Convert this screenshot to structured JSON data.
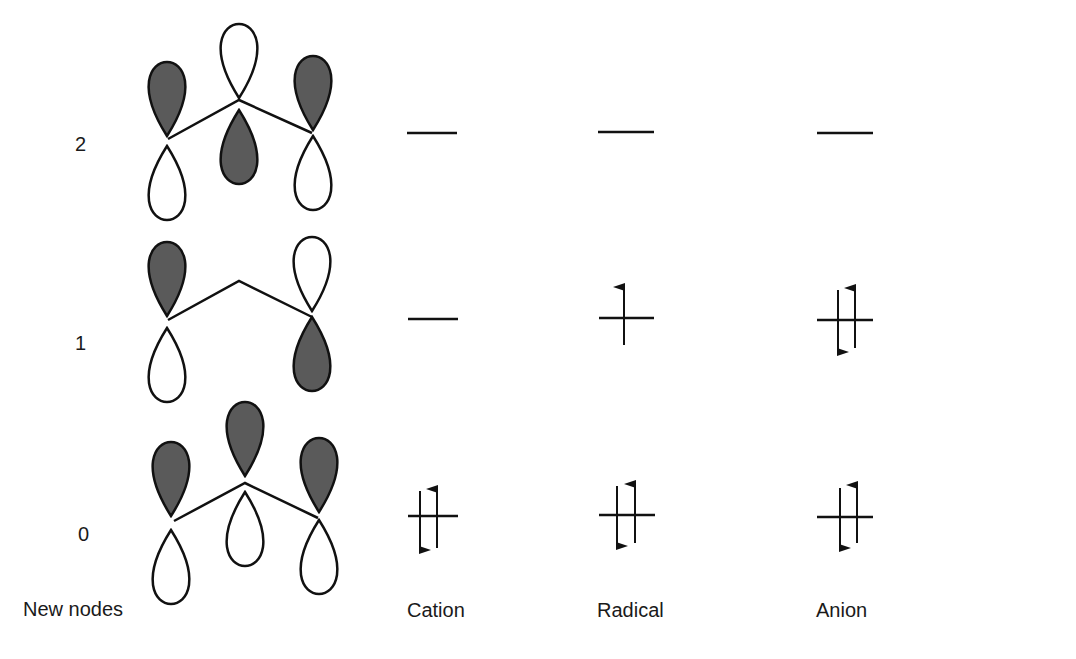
{
  "diagram": {
    "node_levels": [
      {
        "label": "2",
        "description": "psi3: two nodes, alternating phases"
      },
      {
        "label": "1",
        "description": "psi2: one node at central carbon"
      },
      {
        "label": "0",
        "description": "psi1: no nodes, all same phase"
      }
    ],
    "columns": {
      "nodes_header": "New nodes",
      "species": [
        {
          "label": "Cation",
          "occupancy": {
            "level0": 2,
            "level1": 0,
            "level2": 0
          }
        },
        {
          "label": "Radical",
          "occupancy": {
            "level0": 2,
            "level1": 1,
            "level2": 0
          }
        },
        {
          "label": "Anion",
          "occupancy": {
            "level0": 2,
            "level1": 2,
            "level2": 0
          }
        }
      ]
    },
    "colors": {
      "shaded_lobe": "#555555",
      "line": "#111111",
      "background": "#ffffff"
    }
  }
}
